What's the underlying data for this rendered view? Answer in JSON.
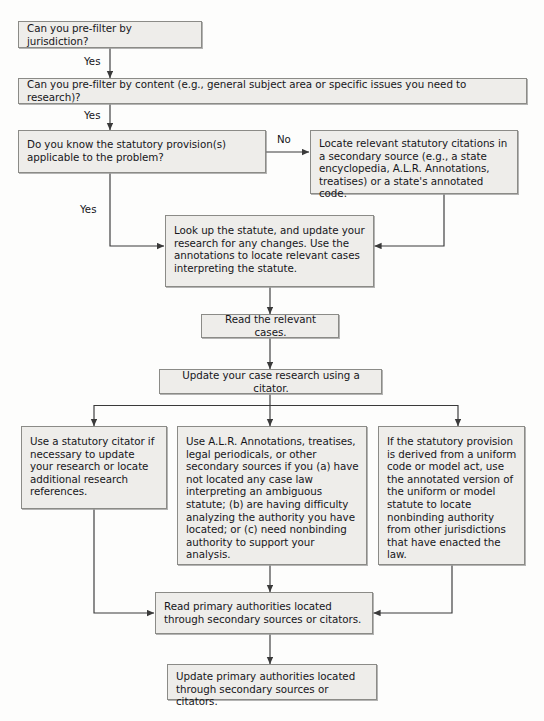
{
  "diagram": {
    "style": {
      "box_fill": "#eeedea",
      "box_border": "#8b8b87",
      "line_color": "#3a3a3a",
      "text_color": "#16161a",
      "page_background": "#fdfdfc"
    },
    "nodes": [
      {
        "id": "n1",
        "text": "Can you pre-filter by jurisdiction?"
      },
      {
        "id": "n2",
        "text": "Can you pre-filter by content (e.g., general subject area or specific issues you need to research)?"
      },
      {
        "id": "n3",
        "text": "Do you know the statutory provision(s) applicable to the problem?"
      },
      {
        "id": "n4",
        "text": "Locate relevant statutory citations in a secondary source (e.g., a state encyclopedia, A.L.R. Annotations, treatises) or a state's annotated code."
      },
      {
        "id": "n5",
        "text": "Look up the statute, and update your research for any changes. Use the annotations to locate relevant cases interpreting the statute."
      },
      {
        "id": "n6",
        "text": "Read the relevant cases."
      },
      {
        "id": "n7",
        "text": "Update your case research using a citator."
      },
      {
        "id": "n8",
        "text": "Use a statutory citator if necessary to update your research or locate additional research references."
      },
      {
        "id": "n9",
        "text": "Use A.L.R. Annotations, treatises, legal periodicals, or other secondary sources if you (a) have not located any case law interpreting an ambiguous statute; (b) are having difficulty analyzing the authority you have located; or (c) need nonbinding authority to support your analysis."
      },
      {
        "id": "n10",
        "text": "If the statutory provision is derived from a uniform code or model act, use the annotated version of the uniform or model statute to locate nonbinding authority from other jurisdictions that have enacted the law."
      },
      {
        "id": "n11",
        "text": "Read primary authorities located through secondary sources or citators."
      },
      {
        "id": "n12",
        "text": "Update primary authorities located through secondary sources or citators."
      }
    ],
    "edge_labels": [
      {
        "id": "e1",
        "text": "Yes"
      },
      {
        "id": "e2",
        "text": "Yes"
      },
      {
        "id": "e3",
        "text": "No"
      },
      {
        "id": "e4",
        "text": "Yes"
      }
    ]
  }
}
